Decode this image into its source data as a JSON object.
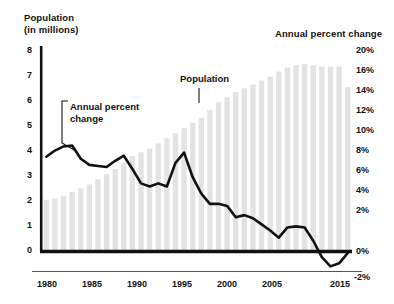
{
  "chart_data": {
    "type": "bar",
    "title": "",
    "left_axis_title_line1": "Population",
    "left_axis_title_line2": "(in millions)",
    "right_axis_title": "Annual percent change",
    "xlabel": "",
    "ylabel": "Population (in millions)",
    "ylabel_right": "Annual percent change",
    "ylim": [
      0,
      8
    ],
    "ylim_right": [
      -2,
      20
    ],
    "grid": false,
    "legend_position": "inline-annotations",
    "left_tick_labels": [
      "8",
      "7",
      "6",
      "5",
      "4",
      "3",
      "2",
      "1",
      "0"
    ],
    "left_tick_values": [
      8,
      7,
      6,
      5,
      4,
      3,
      2,
      1,
      0
    ],
    "right_tick_labels": [
      "20%",
      "",
      "16%",
      "14%",
      "12%",
      "10%",
      "8%",
      "6%",
      "4%",
      "2%",
      "0%",
      "-2%"
    ],
    "right_tick_values": [
      20,
      18,
      16,
      14,
      12,
      10,
      8,
      6,
      4,
      2,
      0,
      -2
    ],
    "x_tick_labels": [
      "1980",
      "1985",
      "1990",
      "1995",
      "2000",
      "2005",
      "2015"
    ],
    "x_tick_values": [
      1980,
      1985,
      1990,
      1995,
      2000,
      2005,
      2015
    ],
    "x": [
      1980,
      1981,
      1982,
      1983,
      1984,
      1985,
      1986,
      1987,
      1988,
      1989,
      1990,
      1991,
      1992,
      1993,
      1994,
      1995,
      1996,
      1997,
      1998,
      1999,
      2000,
      2001,
      2002,
      2003,
      2004,
      2005,
      2006,
      2007,
      2008,
      2009,
      2010,
      2011,
      2012,
      2013,
      2014,
      2015
    ],
    "categories": [
      "1980",
      "1981",
      "1982",
      "1983",
      "1984",
      "1985",
      "1986",
      "1987",
      "1988",
      "1989",
      "1990",
      "1991",
      "1992",
      "1993",
      "1994",
      "1995",
      "1996",
      "1997",
      "1998",
      "1999",
      "2000",
      "2001",
      "2002",
      "2003",
      "2004",
      "2005",
      "2006",
      "2007",
      "2008",
      "2009",
      "2010",
      "2011",
      "2012",
      "2013",
      "2014",
      "2015"
    ],
    "series": [
      {
        "name": "Population",
        "type": "bar",
        "axis": "left",
        "unit": "millions",
        "color": "#e3e3e3",
        "values": [
          2.0,
          2.05,
          2.15,
          2.3,
          2.45,
          2.6,
          2.8,
          3.0,
          3.2,
          3.45,
          3.7,
          3.85,
          4.0,
          4.2,
          4.4,
          4.6,
          4.8,
          5.0,
          5.2,
          5.5,
          5.8,
          6.0,
          6.2,
          6.35,
          6.5,
          6.65,
          6.8,
          7.0,
          7.15,
          7.25,
          7.3,
          7.25,
          7.2,
          7.2,
          7.2,
          6.4
        ]
      },
      {
        "name": "Annual percent change",
        "type": "line",
        "axis": "right",
        "unit": "percent",
        "color": "#111111",
        "values": [
          9.2,
          9.8,
          10.2,
          10.3,
          9.0,
          8.4,
          8.3,
          8.2,
          8.8,
          9.3,
          8.0,
          6.6,
          6.3,
          6.6,
          6.3,
          8.6,
          9.6,
          7.2,
          5.6,
          4.6,
          4.6,
          4.4,
          3.3,
          3.5,
          3.2,
          2.6,
          2.0,
          1.3,
          2.3,
          2.4,
          2.3,
          1.0,
          -0.6,
          -1.5,
          -1.2,
          -0.2
        ]
      }
    ],
    "annotations": [
      {
        "name": "population-annotation",
        "text": "Population"
      },
      {
        "name": "annual-percent-change-annotation",
        "text_line1": "Annual percent",
        "text_line2": "change"
      }
    ]
  },
  "colors": {
    "bar": "#e3e3e3",
    "line": "#111111",
    "axis": "#111111",
    "text": "#111111",
    "background": "#ffffff"
  }
}
